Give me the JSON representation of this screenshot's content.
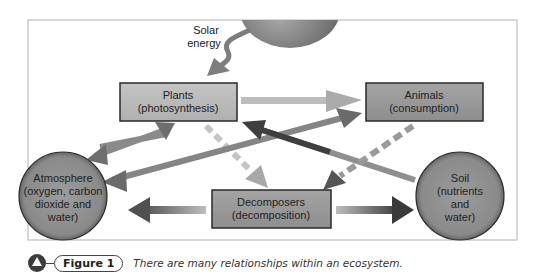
{
  "diagram": {
    "sun_label_line1": "Solar",
    "sun_label_line2": "energy",
    "nodes": {
      "plants": {
        "line1": "Plants",
        "line2": "(photosynthesis)"
      },
      "animals": {
        "line1": "Animals",
        "line2": "(consumption)"
      },
      "decomposers": {
        "line1": "Decomposers",
        "line2": "(decomposition)"
      },
      "atmosphere": {
        "line1": "Atmosphere",
        "line2": "(oxygen, carbon",
        "line3": "dioxide and",
        "line4": "water)"
      },
      "soil": {
        "line1": "Soil",
        "line2": "(nutrients",
        "line3": "and",
        "line4": "water)"
      }
    },
    "colors": {
      "box_fill": "#9a9a9a",
      "box_border": "#2a2a2a",
      "circle_fill": "#8e8e8e",
      "frame": "#bdbdbd",
      "arrow_light": "#b5b5b5",
      "arrow_mid": "#7d7d7d",
      "arrow_dark": "#3e3e3e"
    }
  },
  "caption": {
    "label": "Figure 1",
    "text": "There are many relationships within an ecosystem."
  }
}
